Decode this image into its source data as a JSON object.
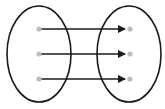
{
  "diagram": {
    "type": "mapping",
    "sets": [
      {
        "id": "domain",
        "elements": 3
      },
      {
        "id": "codomain",
        "elements": 3
      }
    ],
    "mappings": [
      [
        0,
        0
      ],
      [
        1,
        1
      ],
      [
        2,
        2
      ]
    ],
    "colors": {
      "ellipse_stroke": "#1a1a1a",
      "arrow": "#1a1a1a",
      "dot": "#bdbdbd"
    }
  }
}
